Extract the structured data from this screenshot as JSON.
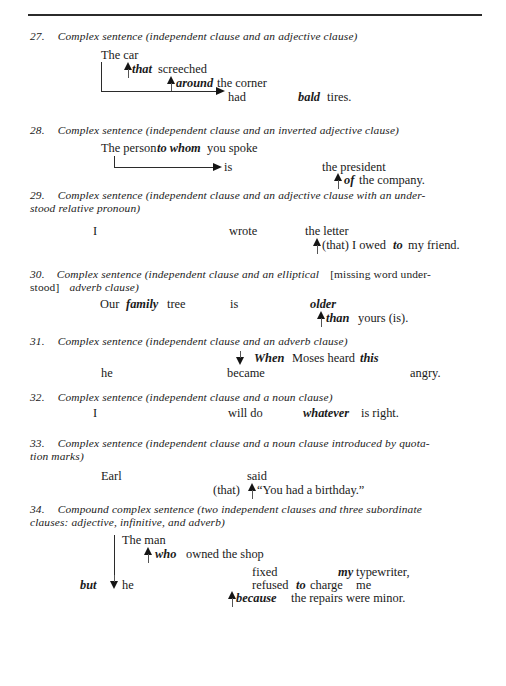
{
  "page": {
    "top_rule": true,
    "ink_color": "#1a1a1a"
  },
  "items": [
    {
      "number": "27.",
      "heading": "Complex sentence (independent clause and an adjective clause)",
      "lines": [
        {
          "text": "The car"
        },
        {
          "text": "that",
          "style": "bold-italic",
          "arrow": "up"
        },
        {
          "text": "screeched"
        },
        {
          "text": "around",
          "style": "bold-italic",
          "arrow": "up"
        },
        {
          "text": "the corner"
        },
        {
          "text": "had",
          "arrow": "elbow-right"
        },
        {
          "text": "bald",
          "style": "bold-italic"
        },
        {
          "text": "tires."
        }
      ]
    },
    {
      "number": "28.",
      "heading": "Complex sentence (independent clause and an inverted adjective clause)",
      "lines": [
        {
          "text": "The person"
        },
        {
          "text": "to whom",
          "style": "bold-italic"
        },
        {
          "text": "you spoke"
        },
        {
          "text": "is",
          "arrow": "elbow-right"
        },
        {
          "text": "the president"
        },
        {
          "text": "of",
          "style": "bold-italic",
          "arrow": "up"
        },
        {
          "text": "the company."
        }
      ]
    },
    {
      "number": "29.",
      "heading": "Complex sentence (independent clause and an adjective clause with an understood relative pronoun)",
      "lines": [
        {
          "text": "I"
        },
        {
          "text": "wrote"
        },
        {
          "text": "the letter"
        },
        {
          "text": "(that) I owed",
          "arrow": "up"
        },
        {
          "text": "to",
          "style": "bold-italic"
        },
        {
          "text": "my friend."
        }
      ]
    },
    {
      "number": "30.",
      "heading_parts": [
        {
          "text": "Complex sentence (independent clause and an elliptical ",
          "style": "italic"
        },
        {
          "text": "[missing word understood]",
          "style": "roman"
        },
        {
          "text": " adverb clause)",
          "style": "italic"
        }
      ],
      "heading": "Complex sentence (independent clause and an elliptical [missing word understood] adverb clause)",
      "lines": [
        {
          "text": "Our"
        },
        {
          "text": "family",
          "style": "bold-italic"
        },
        {
          "text": "tree"
        },
        {
          "text": "is"
        },
        {
          "text": "older",
          "style": "bold-italic"
        },
        {
          "text": "than",
          "style": "bold-italic",
          "arrow": "up"
        },
        {
          "text": "yours (is)."
        }
      ]
    },
    {
      "number": "31.",
      "heading": "Complex sentence (independent clause and an adverb clause)",
      "lines": [
        {
          "text": "When",
          "style": "bold-italic",
          "arrow": "down"
        },
        {
          "text": "Moses heard"
        },
        {
          "text": "this",
          "style": "bold-italic"
        },
        {
          "text": "he"
        },
        {
          "text": "became"
        },
        {
          "text": "angry."
        }
      ]
    },
    {
      "number": "32.",
      "heading": "Complex sentence (independent clause and a noun clause)",
      "lines": [
        {
          "text": "I"
        },
        {
          "text": "will do"
        },
        {
          "text": "whatever",
          "style": "bold-italic"
        },
        {
          "text": "is right."
        }
      ]
    },
    {
      "number": "33.",
      "heading": "Complex sentence (independent clause and a noun clause introduced by quotation marks)",
      "lines": [
        {
          "text": "Earl"
        },
        {
          "text": "said"
        },
        {
          "text": "(that)",
          "arrow": "up"
        },
        {
          "text": "“You had a birthday.”"
        }
      ]
    },
    {
      "number": "34.",
      "heading": "Compound complex sentence (two independent clauses and three subordinate clauses: adjective, infinitive, and adverb)",
      "lines": [
        {
          "text": "The man"
        },
        {
          "text": "who",
          "style": "bold-italic",
          "arrow": "up"
        },
        {
          "text": "owned the shop"
        },
        {
          "text": "fixed"
        },
        {
          "text": "my",
          "style": "bold-italic"
        },
        {
          "text": "typewriter,"
        },
        {
          "text": "but",
          "style": "bold-italic",
          "arrow": "down"
        },
        {
          "text": "he"
        },
        {
          "text": "refused"
        },
        {
          "text": "to",
          "style": "bold-italic"
        },
        {
          "text": "charge"
        },
        {
          "text": "me"
        },
        {
          "text": "because",
          "style": "bold-italic",
          "arrow": "up"
        },
        {
          "text": "the repairs were minor."
        }
      ]
    }
  ],
  "text": {
    "i27_heading_num": "27.",
    "i27_heading": "Complex sentence (independent clause and an adjective clause)",
    "i27_the_car": "The car",
    "i27_that": "that",
    "i27_screeched": "screeched",
    "i27_around": "around",
    "i27_the_corner": "the corner",
    "i27_had": "had",
    "i27_bald": "bald",
    "i27_tires": "tires.",
    "i28_heading_num": "28.",
    "i28_heading": "Complex sentence (independent clause and an inverted adjective clause)",
    "i28_the_person": "The person",
    "i28_to_whom": "to whom",
    "i28_you_spoke": "you spoke",
    "i28_is": "is",
    "i28_the_president": "the president",
    "i28_of": "of",
    "i28_the_company": "the company.",
    "i29_heading_num": "29.",
    "i29_heading_l1": "Complex sentence (independent clause and an adjective clause with an under-",
    "i29_heading_l2": "stood relative pronoun)",
    "i29_i": "I",
    "i29_wrote": "wrote",
    "i29_the_letter": "the letter",
    "i29_that_i_owed": "(that) I owed",
    "i29_to": "to",
    "i29_my_friend": "my friend.",
    "i30_heading_num": "30.",
    "i30_heading_a": "Complex sentence (independent clause and an elliptical",
    "i30_heading_b": "[missing word under-",
    "i30_heading_c": "stood]",
    "i30_heading_d": "adverb clause)",
    "i30_our": "Our",
    "i30_family": "family",
    "i30_tree": "tree",
    "i30_is": "is",
    "i30_older": "older",
    "i30_than": "than",
    "i30_yours": "yours (is).",
    "i31_heading_num": "31.",
    "i31_heading": "Complex sentence (independent clause and an adverb clause)",
    "i31_when": "When",
    "i31_moses_heard": "Moses heard",
    "i31_this": "this",
    "i31_he": "he",
    "i31_became": "became",
    "i31_angry": "angry.",
    "i32_heading_num": "32.",
    "i32_heading": "Complex sentence (independent clause and a noun clause)",
    "i32_i": "I",
    "i32_will_do": "will do",
    "i32_whatever": "whatever",
    "i32_is_right": "is right.",
    "i33_heading_num": "33.",
    "i33_heading_l1": "Complex sentence (independent clause and a noun clause introduced by quota-",
    "i33_heading_l2": "tion marks)",
    "i33_earl": "Earl",
    "i33_said": "said",
    "i33_that": "(that)",
    "i33_quote": "“You had a birthday.”",
    "i34_heading_num": "34.",
    "i34_heading_l1": "Compound complex sentence (two independent clauses and three subordinate",
    "i34_heading_l2": "clauses: adjective, infinitive, and adverb)",
    "i34_the_man": "The man",
    "i34_who": "who",
    "i34_owned_the_shop": "owned the shop",
    "i34_fixed": "fixed",
    "i34_my": "my",
    "i34_typewriter": "typewriter,",
    "i34_but": "but",
    "i34_he": "he",
    "i34_refused": "refused",
    "i34_to": "to",
    "i34_charge": "charge",
    "i34_me": "me",
    "i34_because": "because",
    "i34_repairs": "the repairs were minor."
  }
}
